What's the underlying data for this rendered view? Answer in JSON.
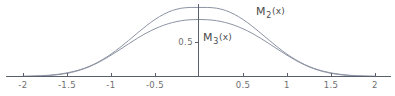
{
  "figure": {
    "background_color": "#ffffff",
    "axis_color": "#5a5f6e",
    "curve_color": "#8c93a3",
    "tick_text_color": "#6e6e6e",
    "label_text_color": "#4a4a4a"
  },
  "chart_data": {
    "type": "line",
    "title": "",
    "xlabel": "",
    "ylabel": "",
    "xlim": [
      -2.0,
      2.0
    ],
    "ylim": [
      0.0,
      1.05
    ],
    "grid": false,
    "legend": "inline-annotations",
    "x_ticks": [
      -2,
      -1.5,
      -1,
      -0.5,
      0.5,
      1,
      1.5,
      2
    ],
    "x_tick_labels": [
      "-2",
      "-1.5",
      "-1",
      "-0.5",
      "0.5",
      "1",
      "1.5",
      "2"
    ],
    "y_ticks": [
      0.5
    ],
    "y_tick_labels": [
      "0.5"
    ],
    "annotations": [
      {
        "name": "M2-curve-label",
        "base": "M",
        "subscript": "2",
        "argument": "(x)",
        "x": 0.66,
        "y": 0.94
      },
      {
        "name": "M3-curve-label",
        "base": "M",
        "subscript": "3",
        "argument": "(x)",
        "x": 0.07,
        "y": 0.57
      }
    ],
    "series": [
      {
        "name": "M_2(x)",
        "peak_value": 1.0,
        "peak_x": 0.0,
        "x": [
          -2.0,
          -1.9,
          -1.8,
          -1.7,
          -1.6,
          -1.5,
          -1.4,
          -1.3,
          -1.2,
          -1.1,
          -1.0,
          -0.9,
          -0.8,
          -0.7,
          -0.6,
          -0.5,
          -0.4,
          -0.3,
          -0.2,
          -0.1,
          0.0,
          0.1,
          0.2,
          0.3,
          0.4,
          0.5,
          0.6,
          0.7,
          0.8,
          0.9,
          1.0,
          1.1,
          1.2,
          1.3,
          1.4,
          1.5,
          1.6,
          1.7,
          1.8,
          1.9,
          2.0
        ],
        "values": [
          0.003,
          0.006,
          0.011,
          0.019,
          0.032,
          0.052,
          0.081,
          0.121,
          0.174,
          0.242,
          0.324,
          0.418,
          0.522,
          0.629,
          0.733,
          0.826,
          0.902,
          0.957,
          0.989,
          1.0,
          1.0,
          1.0,
          0.989,
          0.957,
          0.902,
          0.826,
          0.733,
          0.629,
          0.522,
          0.418,
          0.324,
          0.242,
          0.174,
          0.121,
          0.081,
          0.052,
          0.032,
          0.019,
          0.011,
          0.006,
          0.003
        ]
      },
      {
        "name": "M_3(x)",
        "peak_value": 0.85,
        "peak_x": 0.0,
        "x": [
          -2.0,
          -1.9,
          -1.8,
          -1.7,
          -1.6,
          -1.5,
          -1.4,
          -1.3,
          -1.2,
          -1.1,
          -1.0,
          -0.9,
          -0.8,
          -0.7,
          -0.6,
          -0.5,
          -0.4,
          -0.3,
          -0.2,
          -0.1,
          0.0,
          0.1,
          0.2,
          0.3,
          0.4,
          0.5,
          0.6,
          0.7,
          0.8,
          0.9,
          1.0,
          1.1,
          1.2,
          1.3,
          1.4,
          1.5,
          1.6,
          1.7,
          1.8,
          1.9,
          2.0
        ],
        "values": [
          0.002,
          0.004,
          0.008,
          0.015,
          0.027,
          0.046,
          0.075,
          0.115,
          0.168,
          0.233,
          0.308,
          0.389,
          0.473,
          0.554,
          0.628,
          0.691,
          0.743,
          0.782,
          0.808,
          0.822,
          0.826,
          0.822,
          0.808,
          0.782,
          0.743,
          0.691,
          0.628,
          0.554,
          0.473,
          0.389,
          0.308,
          0.233,
          0.168,
          0.115,
          0.075,
          0.046,
          0.027,
          0.015,
          0.008,
          0.004,
          0.002
        ]
      }
    ]
  }
}
